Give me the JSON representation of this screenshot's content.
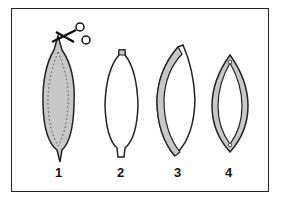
{
  "diagram": {
    "title": "",
    "steps": [
      {
        "label": "1",
        "description": "Gray fusiform shape with dotted inner cut line; scissors cutting at top tip"
      },
      {
        "label": "2",
        "description": "White fusiform shape with tabs at top and bottom"
      },
      {
        "label": "3",
        "description": "Shape with gray left band partially separated"
      },
      {
        "label": "4",
        "description": "Gray lens-shaped ring with white interior and small holes at both tips"
      }
    ],
    "colors": {
      "fill_gray": "#c8c8c8",
      "stroke": "#222222",
      "background": "#ffffff"
    }
  }
}
